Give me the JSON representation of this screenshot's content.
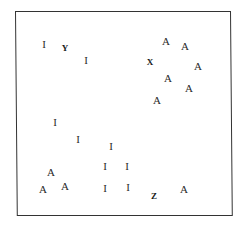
{
  "figure": {
    "frame": {
      "left": 15,
      "top": 11,
      "right": 232,
      "bottom": 217,
      "border_color": "#333333"
    },
    "letters": [
      {
        "char": "I",
        "x": 44,
        "y": 44,
        "style": "regular",
        "group": "I"
      },
      {
        "char": "Y",
        "x": 65,
        "y": 48,
        "style": "bold",
        "group": "target"
      },
      {
        "char": "I",
        "x": 86,
        "y": 60,
        "style": "regular",
        "group": "I"
      },
      {
        "char": "A",
        "x": 166,
        "y": 41,
        "style": "regular",
        "group": "A"
      },
      {
        "char": "A",
        "x": 185,
        "y": 46,
        "style": "regular",
        "group": "A"
      },
      {
        "char": "X",
        "x": 150,
        "y": 62,
        "style": "bold",
        "group": "target"
      },
      {
        "char": "A",
        "x": 198,
        "y": 66,
        "style": "regular",
        "group": "A"
      },
      {
        "char": "A",
        "x": 168,
        "y": 78,
        "style": "regular",
        "group": "A"
      },
      {
        "char": "A",
        "x": 189,
        "y": 88,
        "style": "regular",
        "group": "A"
      },
      {
        "char": "A",
        "x": 157,
        "y": 100,
        "style": "regular",
        "group": "A"
      },
      {
        "char": "I",
        "x": 55,
        "y": 122,
        "style": "regular",
        "group": "I"
      },
      {
        "char": "I",
        "x": 78,
        "y": 139,
        "style": "regular",
        "group": "I"
      },
      {
        "char": "I",
        "x": 111,
        "y": 146,
        "style": "regular",
        "group": "I"
      },
      {
        "char": "I",
        "x": 105,
        "y": 166,
        "style": "regular",
        "group": "I"
      },
      {
        "char": "I",
        "x": 127,
        "y": 166,
        "style": "regular",
        "group": "I"
      },
      {
        "char": "A",
        "x": 51,
        "y": 172,
        "style": "regular",
        "group": "A"
      },
      {
        "char": "A",
        "x": 43,
        "y": 189,
        "style": "regular",
        "group": "A"
      },
      {
        "char": "A",
        "x": 65,
        "y": 186,
        "style": "regular",
        "group": "A"
      },
      {
        "char": "I",
        "x": 105,
        "y": 188,
        "style": "regular",
        "group": "I"
      },
      {
        "char": "I",
        "x": 128,
        "y": 187,
        "style": "regular",
        "group": "I"
      },
      {
        "char": "Z",
        "x": 154,
        "y": 196,
        "style": "bold",
        "group": "target"
      },
      {
        "char": "A",
        "x": 184,
        "y": 189,
        "style": "regular",
        "group": "A"
      }
    ]
  }
}
